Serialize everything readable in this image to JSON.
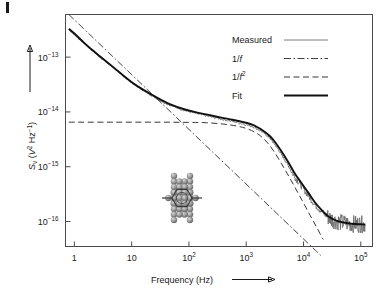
{
  "figure": {
    "marker_present": true
  },
  "chart_data": {
    "type": "line",
    "title": "",
    "xlabel": "Frequency (Hz)",
    "ylabel": "Sᵥ (V² Hz⁻¹)",
    "ylabel_base": "S",
    "ylabel_sub": "v",
    "ylabel_rest": " (V",
    "ylabel_rest2": " Hz",
    "ylabel_close": ")",
    "xscale": "log",
    "yscale": "log",
    "xlim": [
      0.7,
      160000
    ],
    "ylim": [
      3.5e-17,
      6e-13
    ],
    "grid": false,
    "legend_position": "top-right",
    "xticks": [
      {
        "value": 1,
        "mantissa": "1",
        "exponent": ""
      },
      {
        "value": 10,
        "mantissa": "10",
        "exponent": ""
      },
      {
        "value": 100,
        "mantissa": "10",
        "exponent": "2"
      },
      {
        "value": 1000,
        "mantissa": "10",
        "exponent": "3"
      },
      {
        "value": 10000,
        "mantissa": "10",
        "exponent": "4"
      },
      {
        "value": 100000,
        "mantissa": "10",
        "exponent": "5"
      }
    ],
    "yticks": [
      {
        "value": 1e-13,
        "mantissa": "10",
        "exponent": "−13"
      },
      {
        "value": 1e-14,
        "mantissa": "10",
        "exponent": "−14"
      },
      {
        "value": 1e-15,
        "mantissa": "10",
        "exponent": "−15"
      },
      {
        "value": 1e-16,
        "mantissa": "10",
        "exponent": "−16"
      }
    ],
    "legend": [
      {
        "label": "Measured",
        "style": "thin-solid",
        "color": "#555555"
      },
      {
        "label": "1/f",
        "style": "dash-dot",
        "color": "#222222"
      },
      {
        "label": "1/f²",
        "style": "dashed",
        "color": "#222222"
      },
      {
        "label": "Fit",
        "style": "thick-solid",
        "color": "#111111"
      }
    ],
    "series": [
      {
        "name": "Measured",
        "style": "thin-solid",
        "x": [
          0.8,
          1,
          1.5,
          2,
          3,
          5,
          8,
          12,
          20,
          32,
          50,
          80,
          130,
          200,
          320,
          500,
          800,
          1300,
          2000,
          2600,
          3200,
          4000,
          5200,
          7000,
          9000,
          12000,
          16000,
          21000,
          27000,
          34000,
          45000,
          60000,
          80000,
          100000,
          120000
        ],
        "y": [
          3.2e-13,
          2.6e-13,
          1.75e-13,
          1.35e-13,
          9.5e-14,
          6.2e-14,
          4.1e-14,
          3e-14,
          2.15e-14,
          1.6e-14,
          1.28e-14,
          1.08e-14,
          9.4e-15,
          8.5e-15,
          7.6e-15,
          6.9e-15,
          6.2e-15,
          5.4e-15,
          4.2e-15,
          3.3e-15,
          2.5e-15,
          1.75e-15,
          1.12e-15,
          6.6e-16,
          4.6e-16,
          3e-16,
          2e-16,
          1.5e-16,
          1.2e-16,
          1.05e-16,
          9.6e-17,
          9.2e-17,
          9e-17,
          8.9e-17,
          8.8e-17
        ]
      },
      {
        "name": "1/f",
        "style": "dash-dot",
        "x": [
          0.8,
          2,
          5,
          12,
          30,
          80,
          200,
          500,
          1300,
          3200,
          8000,
          16000,
          20000
        ],
        "y": [
          6e-13,
          2.4e-13,
          9.6e-14,
          4e-14,
          1.6e-14,
          6e-15,
          2.4e-15,
          9.6e-16,
          3.7e-16,
          1.5e-16,
          6e-17,
          3e-17,
          2.4e-17
        ]
      },
      {
        "name": "1/f²",
        "style": "dashed",
        "x": [
          0.8,
          5,
          30,
          100,
          200,
          400,
          700,
          1000,
          1400,
          1800,
          2300,
          3000,
          4000,
          5200,
          7000,
          9500,
          13000,
          17000,
          22000
        ],
        "y": [
          6.5e-15,
          6.5e-15,
          6.5e-15,
          6.45e-15,
          6.35e-15,
          6e-15,
          5.5e-15,
          5e-15,
          4.3e-15,
          3.6e-15,
          2.8e-15,
          1.95e-15,
          1.2e-15,
          7.5e-16,
          4.3e-16,
          2.4e-16,
          1.3e-16,
          7.8e-17,
          4.7e-17
        ]
      },
      {
        "name": "Fit",
        "style": "thick-solid",
        "x": [
          0.8,
          1,
          1.5,
          2,
          3,
          5,
          8,
          12,
          20,
          32,
          50,
          80,
          130,
          200,
          320,
          500,
          800,
          1300,
          2000,
          2600,
          3200,
          4000,
          5200,
          7000,
          9000,
          12000,
          16000,
          21000,
          27000,
          34000,
          45000,
          60000,
          80000,
          100000,
          120000
        ],
        "y": [
          3.3e-13,
          2.7e-13,
          1.8e-13,
          1.38e-13,
          9.7e-14,
          6.3e-14,
          4.2e-14,
          3.05e-14,
          2.2e-14,
          1.68e-14,
          1.34e-14,
          1.13e-14,
          9.9e-15,
          9e-15,
          8.1e-15,
          7.4e-15,
          6.7e-15,
          5.8e-15,
          4.5e-15,
          3.6e-15,
          2.8e-15,
          2e-15,
          1.3e-15,
          7.6e-16,
          5.2e-16,
          3.4e-16,
          2.2e-16,
          1.6e-16,
          1.25e-16,
          1.08e-16,
          9.8e-17,
          9.3e-17,
          9e-17,
          8.9e-17,
          8.8e-17
        ]
      }
    ],
    "annotations": [
      {
        "name": "molecular-junction-inset",
        "description": "gold electrode tips bridged by benzene molecule"
      }
    ]
  }
}
